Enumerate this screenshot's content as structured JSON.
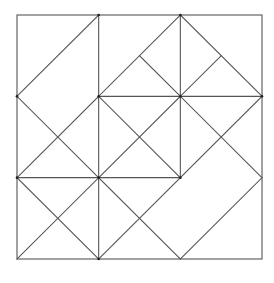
{
  "diagram": {
    "type": "geometric-tiling",
    "stroke_color": "#555555",
    "background": "#ffffff",
    "stroke_width": 1.1,
    "origin_px": [
      17,
      15
    ],
    "cell_px": [
      81.67,
      81.33
    ],
    "grid_size": 3,
    "outer_square": [
      [
        0,
        0
      ],
      [
        3,
        3
      ]
    ],
    "segments": [
      {
        "from": [
          1,
          0
        ],
        "to": [
          1,
          3
        ],
        "kind": "vertical"
      },
      {
        "from": [
          2,
          0
        ],
        "to": [
          2,
          2
        ],
        "kind": "vertical"
      },
      {
        "from": [
          1,
          1
        ],
        "to": [
          3,
          1
        ],
        "kind": "horizontal"
      },
      {
        "from": [
          0,
          2
        ],
        "to": [
          2,
          2
        ],
        "kind": "horizontal"
      },
      {
        "from": [
          1,
          0
        ],
        "to": [
          0,
          1
        ],
        "kind": "diagonal"
      },
      {
        "from": [
          0,
          1
        ],
        "to": [
          1,
          2
        ],
        "kind": "diagonal"
      },
      {
        "from": [
          1,
          1
        ],
        "to": [
          0,
          2
        ],
        "kind": "diagonal"
      },
      {
        "from": [
          0,
          2
        ],
        "to": [
          1,
          3
        ],
        "kind": "diagonal"
      },
      {
        "from": [
          1,
          2
        ],
        "to": [
          0,
          3
        ],
        "kind": "diagonal"
      },
      {
        "from": [
          1,
          1
        ],
        "to": [
          2,
          0
        ],
        "kind": "diagonal"
      },
      {
        "from": [
          2,
          0
        ],
        "to": [
          3,
          1
        ],
        "kind": "diagonal"
      },
      {
        "from": [
          1.5,
          0.5
        ],
        "to": [
          2,
          1
        ],
        "kind": "diagonal"
      },
      {
        "from": [
          2,
          1
        ],
        "to": [
          2.5,
          0.5
        ],
        "kind": "diagonal"
      },
      {
        "from": [
          1,
          1
        ],
        "to": [
          2,
          2
        ],
        "kind": "diagonal"
      },
      {
        "from": [
          2,
          1
        ],
        "to": [
          1,
          2
        ],
        "kind": "diagonal"
      },
      {
        "from": [
          3,
          1
        ],
        "to": [
          1,
          3
        ],
        "kind": "diagonal"
      },
      {
        "from": [
          2,
          1
        ],
        "to": [
          3,
          2
        ],
        "kind": "diagonal"
      },
      {
        "from": [
          3,
          2
        ],
        "to": [
          2,
          3
        ],
        "kind": "diagonal"
      },
      {
        "from": [
          1,
          2
        ],
        "to": [
          2,
          3
        ],
        "kind": "diagonal"
      }
    ],
    "nodes": [
      [
        1,
        1
      ],
      [
        2,
        1
      ],
      [
        1,
        2
      ],
      [
        2,
        2
      ],
      [
        3,
        1
      ],
      [
        0,
        1
      ],
      [
        0,
        2
      ],
      [
        1,
        0
      ],
      [
        2,
        0
      ],
      [
        1,
        3
      ]
    ]
  }
}
